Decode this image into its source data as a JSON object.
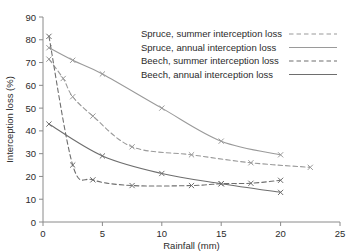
{
  "chart_data": {
    "type": "line",
    "title": "",
    "xlabel": "Rainfall (mm)",
    "ylabel": "Interception loss (%)",
    "xlim": [
      0,
      25
    ],
    "ylim": [
      0,
      90
    ],
    "xticks": [
      0,
      5,
      10,
      15,
      20,
      25
    ],
    "yticks": [
      0,
      10,
      20,
      30,
      40,
      50,
      60,
      70,
      80,
      90
    ],
    "grid": false,
    "legend_position": "top-right",
    "marker": "x",
    "series": [
      {
        "name": "Spruce, summer interception loss",
        "style": "dashed",
        "color": "#9a9a9a",
        "x": [
          0.5,
          1.7,
          2.5,
          4.2,
          7.5,
          12.5,
          17.5,
          22.5
        ],
        "y": [
          71.5,
          63.0,
          55.0,
          46.5,
          33.0,
          29.5,
          26.0,
          24.0
        ]
      },
      {
        "name": "Spruce, annual interception loss",
        "style": "solid",
        "color": "#9a9a9a",
        "x": [
          0.5,
          2.5,
          5.0,
          10.0,
          15.0,
          20.0
        ],
        "y": [
          76.5,
          71.0,
          65.0,
          50.0,
          35.5,
          29.5
        ]
      },
      {
        "name": "Beech, summer interception loss",
        "style": "dashed",
        "color": "#6e6e6e",
        "x": [
          0.5,
          2.5,
          4.2,
          7.5,
          12.5,
          15.0,
          17.5,
          20.0
        ],
        "y": [
          81.5,
          25.0,
          18.5,
          16.0,
          16.0,
          16.8,
          17.0,
          18.3
        ]
      },
      {
        "name": "Beech, annual interception loss",
        "style": "solid",
        "color": "#6e6e6e",
        "x": [
          0.5,
          5.0,
          10.0,
          15.0,
          20.0
        ],
        "y": [
          43.0,
          29.0,
          21.3,
          16.8,
          13.0
        ]
      }
    ]
  },
  "axes": {
    "xlabel": "Rainfall (mm)",
    "ylabel": "Interception loss (%)",
    "xticklabels": [
      "0",
      "5",
      "10",
      "15",
      "20",
      "25"
    ],
    "yticklabels": [
      "0",
      "10",
      "20",
      "30",
      "40",
      "50",
      "60",
      "70",
      "80",
      "90"
    ],
    "axis_color": "#8a8a8a"
  },
  "legend": {
    "items": [
      {
        "label": "Spruce, summer interception loss",
        "style": "dashed",
        "color": "#9a9a9a"
      },
      {
        "label": "Spruce, annual interception loss",
        "style": "solid",
        "color": "#9a9a9a"
      },
      {
        "label": "Beech, summer interception loss",
        "style": "dashed",
        "color": "#6e6e6e"
      },
      {
        "label": "Beech, annual interception loss",
        "style": "solid",
        "color": "#6e6e6e"
      }
    ]
  },
  "colors": {
    "background": "#ffffff",
    "text": "#2b2b2b",
    "spruce": "#9a9a9a",
    "beech": "#6e6e6e",
    "axis": "#8a8a8a"
  }
}
